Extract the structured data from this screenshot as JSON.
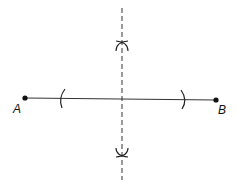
{
  "diagram": {
    "points": [
      {
        "label": "A",
        "x": 25,
        "y": 98
      },
      {
        "label": "B",
        "x": 216,
        "y": 100
      }
    ],
    "colors": {
      "stroke": "#222222",
      "background": "#ffffff"
    }
  }
}
